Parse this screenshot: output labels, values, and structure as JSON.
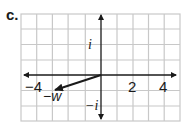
{
  "figure": {
    "panel_label": "c.",
    "x_ticks": [
      {
        "label": "−4",
        "value": -4
      },
      {
        "label": "2",
        "value": 2
      },
      {
        "label": "4",
        "value": 4
      }
    ],
    "y_ticks": [
      {
        "label": "i",
        "value": 1
      },
      {
        "label": "−i",
        "value": -1
      }
    ],
    "vector": {
      "label": "−w",
      "from": [
        0,
        0
      ],
      "to": [
        -3,
        -1
      ]
    },
    "grid": {
      "x_range": [
        -5,
        5
      ],
      "y_range": [
        -2.5,
        2.5
      ],
      "unit_px": 15.7
    },
    "colors": {
      "grid": "#c8c8c8",
      "axis": "#1a1a1a",
      "vector": "#1a1a1a"
    }
  }
}
